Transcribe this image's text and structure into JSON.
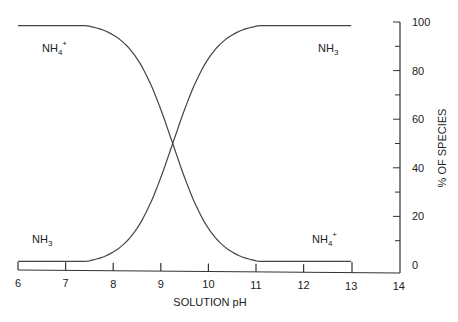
{
  "chart_data": {
    "type": "line",
    "title": "",
    "xlabel": "SOLUTION pH",
    "ylabel": "% OF SPECIES",
    "x_ticks": [
      6,
      7,
      8,
      9,
      10,
      11,
      12,
      13,
      14
    ],
    "y_ticks": [
      0,
      20,
      40,
      60,
      80,
      100
    ],
    "xlim": [
      6,
      14
    ],
    "ylim": [
      0,
      100
    ],
    "grid": false,
    "y_axis_position": "right",
    "x": [
      6,
      7,
      8,
      8.5,
      9,
      9.25,
      9.5,
      10,
      10.5,
      11,
      12,
      13
    ],
    "series": [
      {
        "name": "NH4+",
        "values": [
          99.9,
          99.4,
          94.7,
          85,
          64,
          50,
          36,
          15,
          5.3,
          1.7,
          0.2,
          0.02
        ]
      },
      {
        "name": "NH3",
        "values": [
          0.1,
          0.6,
          5.3,
          15,
          36,
          50,
          64,
          85,
          94.7,
          98.3,
          99.8,
          99.98
        ]
      }
    ],
    "annotations": [
      {
        "text": "NH",
        "sub": "4",
        "sup": "+",
        "position": "upper-left"
      },
      {
        "text": "NH",
        "sub": "3",
        "sup": "",
        "position": "upper-right"
      },
      {
        "text": "NH",
        "sub": "3",
        "sup": "",
        "position": "lower-left"
      },
      {
        "text": "NH",
        "sub": "4",
        "sup": "+",
        "position": "lower-right"
      }
    ],
    "crossover_pH": 9.25
  }
}
